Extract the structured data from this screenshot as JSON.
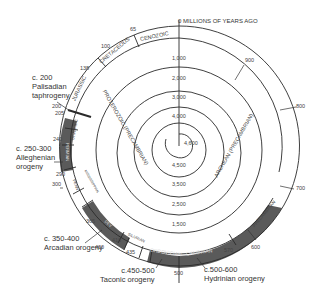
{
  "title": "0 MILLIONS OF YEARS AGO",
  "spiral_scale": {
    "center_label": "4,600",
    "vertical_axis_ticks": [
      "1,000",
      "2,000",
      "3,000",
      "4,000"
    ],
    "lower_axis_ticks": [
      "4,500",
      "3,500",
      "2,500",
      "1,500"
    ]
  },
  "eras": [
    {
      "name": "CENOZOIC"
    },
    {
      "name": "CRETACEOUS"
    },
    {
      "name": "JURASSIC"
    },
    {
      "name": "TRIAS-SIC"
    },
    {
      "name": "PERMIAN"
    },
    {
      "name": "PENN"
    },
    {
      "name": "MISSISSIPPIAN"
    },
    {
      "name": "DEV"
    },
    {
      "name": "SILURIAN"
    },
    {
      "name": "ORDOVICIAN"
    },
    {
      "name": "CAMBRIAN"
    },
    {
      "name": "PROTEROZOIC (PRECAMBRIAN)"
    },
    {
      "name": "ARCHEAN (PRECAMBRIAN)"
    },
    {
      "name": "PRECAMBRIAN"
    }
  ],
  "ring_ticks": [
    "65",
    "100",
    "138",
    "200",
    "205",
    "240",
    "290",
    "300",
    "365",
    "400",
    "410",
    "435",
    "500",
    "570",
    "600",
    "700",
    "800",
    "900"
  ],
  "orogenies": [
    {
      "range": "c. 200",
      "name_line1": "Palisadian",
      "name_line2": "taphrogeny"
    },
    {
      "range": "c. 250-300",
      "name_line1": "Alleghenian",
      "name_line2": "orogeny"
    },
    {
      "range": "c. 350-400",
      "name_line1": "Arcadian orogeny",
      "name_line2": ""
    },
    {
      "range": "c.450-500",
      "name_line1": "Taconic orogeny",
      "name_line2": ""
    },
    {
      "range": "c.500-600",
      "name_line1": "Hydrinian orogeny",
      "name_line2": ""
    }
  ],
  "colors": {
    "line": "#2a2a2a",
    "shade": "#5a5a5a",
    "text": "#333333"
  }
}
